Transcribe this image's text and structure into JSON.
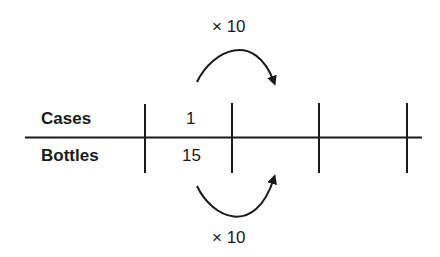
{
  "diagram": {
    "type": "ratio-table",
    "rows": [
      {
        "label": "Cases",
        "values": [
          "1",
          "",
          "",
          ""
        ]
      },
      {
        "label": "Bottles",
        "values": [
          "15",
          "",
          "",
          ""
        ]
      }
    ],
    "top_operation": "× 10",
    "bottom_operation": "× 10"
  }
}
